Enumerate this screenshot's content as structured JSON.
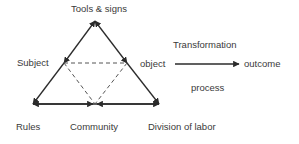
{
  "diagram": {
    "type": "activity-theory-triangle",
    "nodes": {
      "tools": "Tools & signs",
      "subject": "Subject",
      "object": "object",
      "outcome": "outcome",
      "rules": "Rules",
      "community": "Community",
      "division": "Division of labor"
    },
    "annotations": {
      "transformation": "Transformation",
      "process": "process"
    },
    "colors": {
      "line": "#2b2b2b",
      "dashed": "#555555",
      "text": "#3a3a3a",
      "background": "#ffffff"
    }
  }
}
